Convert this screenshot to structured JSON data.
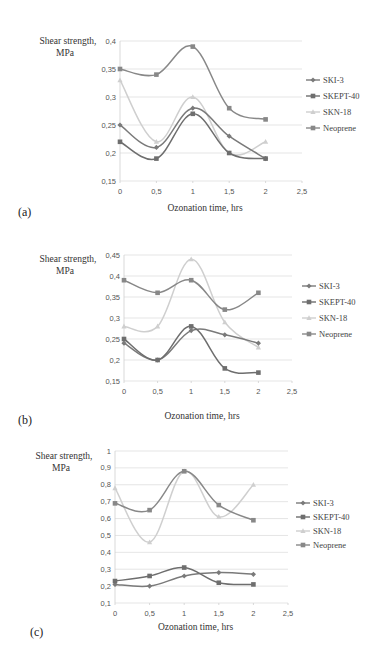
{
  "chart_data": [
    {
      "type": "line",
      "panel_label": "(a)",
      "title": "",
      "xlabel": "Ozonation time, hrs",
      "ylabel": [
        "Shear strength,",
        "MPa"
      ],
      "x": [
        0,
        0.5,
        1,
        1.5,
        2
      ],
      "xlim": [
        0,
        2.5
      ],
      "xticks": [
        "0",
        "0,5",
        "1",
        "1,5",
        "2",
        "2,5"
      ],
      "ylim": [
        0.15,
        0.4
      ],
      "yticks": [
        "0,15",
        "0,2",
        "0,25",
        "0,3",
        "0,35",
        "0,4"
      ],
      "ytick_values": [
        0.15,
        0.2,
        0.25,
        0.3,
        0.35,
        0.4
      ],
      "grid": true,
      "legend_position": "right",
      "series": [
        {
          "name": "SKI-3",
          "marker": "diamond",
          "color": "#7a7a7a",
          "values": [
            0.25,
            0.21,
            0.28,
            0.23,
            0.19
          ]
        },
        {
          "name": "SKEPT-40",
          "marker": "square",
          "color": "#6e6e6e",
          "values": [
            0.22,
            0.19,
            0.27,
            0.2,
            0.19
          ]
        },
        {
          "name": "SKN-18",
          "marker": "triangle",
          "color": "#cfcfcf",
          "values": [
            0.33,
            0.22,
            0.3,
            0.2,
            0.22
          ]
        },
        {
          "name": "Neoprene",
          "marker": "square",
          "color": "#888888",
          "values": [
            0.35,
            0.34,
            0.39,
            0.28,
            0.26
          ]
        }
      ]
    },
    {
      "type": "line",
      "panel_label": "(b)",
      "title": "",
      "xlabel": "Ozonation time, hrs",
      "ylabel": [
        "Shear strength,",
        "MPa"
      ],
      "x": [
        0,
        0.5,
        1,
        1.5,
        2
      ],
      "xlim": [
        0,
        2.5
      ],
      "xticks": [
        "0",
        "0,5",
        "1",
        "1,5",
        "2",
        "2,5"
      ],
      "ylim": [
        0.15,
        0.45
      ],
      "yticks": [
        "0,15",
        "0,2",
        "0,25",
        "0,3",
        "0,35",
        "0,4",
        "0,45"
      ],
      "ytick_values": [
        0.15,
        0.2,
        0.25,
        0.3,
        0.35,
        0.4,
        0.45
      ],
      "grid": true,
      "legend_position": "right",
      "series": [
        {
          "name": "SKI-3",
          "marker": "diamond",
          "color": "#7a7a7a",
          "values": [
            0.24,
            0.2,
            0.27,
            0.26,
            0.24
          ]
        },
        {
          "name": "SKEPT-40",
          "marker": "square",
          "color": "#6e6e6e",
          "values": [
            0.25,
            0.2,
            0.28,
            0.18,
            0.17
          ]
        },
        {
          "name": "SKN-18",
          "marker": "triangle",
          "color": "#cfcfcf",
          "values": [
            0.28,
            0.28,
            0.44,
            0.29,
            0.23
          ]
        },
        {
          "name": "Neoprene",
          "marker": "square",
          "color": "#888888",
          "values": [
            0.39,
            0.36,
            0.39,
            0.32,
            0.36
          ]
        }
      ]
    },
    {
      "type": "line",
      "panel_label": "(c)",
      "title": "",
      "xlabel": "Ozonation time, hrs",
      "ylabel": [
        "Shear strength,",
        "MPa"
      ],
      "x": [
        0,
        0.5,
        1,
        1.5,
        2
      ],
      "xlim": [
        0,
        2.5
      ],
      "xticks": [
        "0",
        "0,5",
        "1",
        "1,5",
        "2",
        "2,5"
      ],
      "ylim": [
        0.1,
        1
      ],
      "yticks": [
        "0,1",
        "0,2",
        "0,3",
        "0,4",
        "0,5",
        "0,6",
        "0,7",
        "0,8",
        "0,9",
        "1"
      ],
      "ytick_values": [
        0.1,
        0.2,
        0.3,
        0.4,
        0.5,
        0.6,
        0.7,
        0.8,
        0.9,
        1
      ],
      "grid": true,
      "legend_position": "right",
      "series": [
        {
          "name": "SKI-3",
          "marker": "diamond",
          "color": "#7a7a7a",
          "values": [
            0.21,
            0.2,
            0.26,
            0.28,
            0.27
          ]
        },
        {
          "name": "SKEPT-40",
          "marker": "square",
          "color": "#6e6e6e",
          "values": [
            0.23,
            0.26,
            0.31,
            0.22,
            0.21
          ]
        },
        {
          "name": "SKN-18",
          "marker": "triangle",
          "color": "#cfcfcf",
          "values": [
            0.78,
            0.46,
            0.88,
            0.61,
            0.8
          ]
        },
        {
          "name": "Neoprene",
          "marker": "square",
          "color": "#888888",
          "values": [
            0.69,
            0.65,
            0.88,
            0.68,
            0.59
          ]
        }
      ]
    }
  ]
}
